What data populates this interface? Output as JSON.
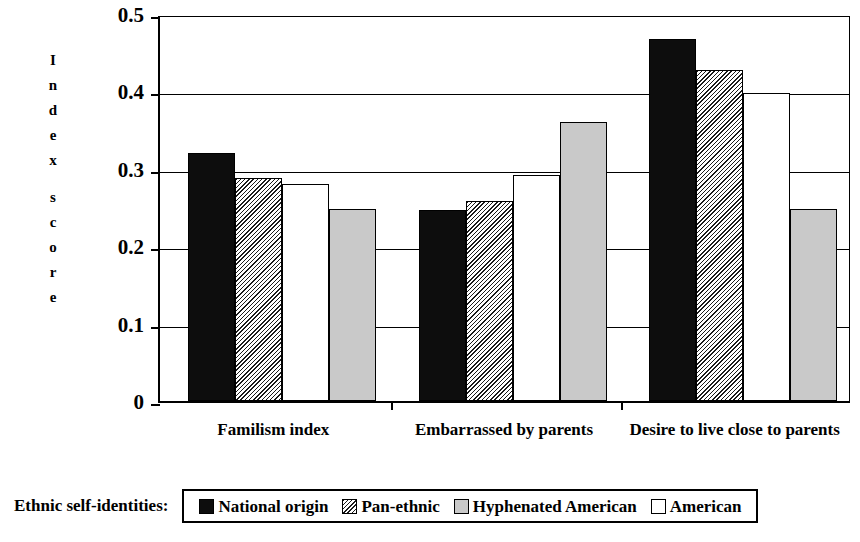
{
  "chart_data": {
    "type": "bar",
    "title": "",
    "xlabel": "",
    "ylabel": "Index score",
    "ylim": [
      0,
      0.5
    ],
    "ytick_labels": [
      "0.5",
      "0.4",
      "0.3",
      "0.2",
      "0.1",
      "0"
    ],
    "ytick_values": [
      0.5,
      0.4,
      0.3,
      0.2,
      0.1,
      0
    ],
    "grid": true,
    "legend_position": "bottom",
    "legend_title": "Ethnic self-identities:",
    "categories": [
      "Familism index",
      "Embarrassed by parents",
      "Desire to live close to parents"
    ],
    "series": [
      {
        "name": "National origin",
        "pattern": "solid-black",
        "color": "#0d0d0d",
        "values": [
          0.32,
          0.247,
          0.468
        ]
      },
      {
        "name": "Pan-ethnic",
        "pattern": "diagonal-hatch",
        "color": "#808080",
        "values": [
          0.288,
          0.258,
          0.428
        ]
      },
      {
        "name": "Hyphenated American",
        "pattern": "solid-lightgray",
        "color": "#c9c9c9",
        "values": [
          0.248,
          0.36,
          0.248
        ]
      },
      {
        "name": "American",
        "pattern": "solid-white",
        "color": "#ffffff",
        "values": [
          0.28,
          0.292,
          0.398
        ]
      }
    ],
    "bar_draw_order": [
      "National origin",
      "Pan-ethnic",
      "American",
      "Hyphenated American"
    ]
  },
  "axis": {
    "ylabel_letters": [
      "I",
      "n",
      "d",
      "e",
      "x",
      "",
      "s",
      "c",
      "o",
      "r",
      "e"
    ]
  },
  "legend": {
    "title": "Ethnic self-identities:",
    "items": [
      {
        "label": "National origin",
        "swatch": "solid-black"
      },
      {
        "label": "Pan-ethnic",
        "swatch": "diagonal-hatch"
      },
      {
        "label": "Hyphenated American",
        "swatch": "solid-lightgray"
      },
      {
        "label": "American",
        "swatch": "solid-white"
      }
    ]
  }
}
